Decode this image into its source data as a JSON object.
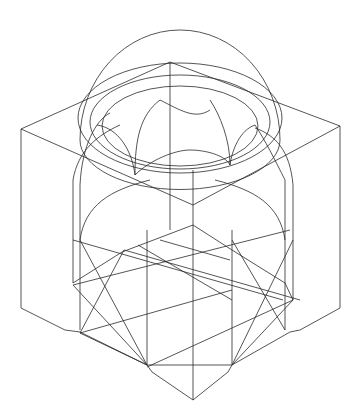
{
  "figure": {
    "stroke_color": "#2a2a2a",
    "background": "#ffffff"
  },
  "geometry": {
    "cube_edges": [
      [
        170,
        62,
        21,
        129
      ],
      [
        170,
        62,
        340,
        126
      ],
      [
        21,
        129,
        193,
        205
      ],
      [
        340,
        126,
        193,
        205
      ],
      [
        21,
        129,
        21,
        308
      ],
      [
        340,
        126,
        340,
        308
      ],
      [
        170,
        62,
        170,
        230
      ],
      [
        21,
        308,
        65,
        330
      ],
      [
        65,
        330,
        80,
        332
      ],
      [
        80,
        332,
        147,
        365
      ],
      [
        147,
        365,
        152,
        372
      ],
      [
        152,
        372,
        193,
        400
      ],
      [
        340,
        308,
        300,
        330
      ],
      [
        300,
        330,
        290,
        332
      ],
      [
        290,
        332,
        232,
        365
      ],
      [
        232,
        365,
        228,
        372
      ],
      [
        228,
        372,
        193,
        400
      ],
      [
        193,
        170,
        193,
        400
      ]
    ],
    "inner_verticals": [
      [
        73,
        180,
        73,
        283
      ],
      [
        80,
        185,
        80,
        330
      ],
      [
        147,
        230,
        147,
        365
      ],
      [
        232,
        230,
        232,
        365
      ],
      [
        285,
        180,
        285,
        330
      ],
      [
        293,
        185,
        293,
        300
      ]
    ],
    "star_lines": [
      [
        73,
        285,
        290,
        230
      ],
      [
        80,
        333,
        232,
        290
      ],
      [
        147,
        367,
        293,
        300
      ],
      [
        73,
        285,
        147,
        365
      ],
      [
        80,
        240,
        147,
        365
      ],
      [
        293,
        240,
        232,
        365
      ],
      [
        80,
        333,
        124,
        250
      ],
      [
        285,
        330,
        232,
        240
      ],
      [
        124,
        250,
        300,
        300
      ],
      [
        73,
        240,
        283,
        300
      ],
      [
        160,
        240,
        230,
        260
      ],
      [
        138,
        245,
        232,
        300
      ]
    ],
    "octagon_base": [
      [
        73,
        283
      ],
      [
        122,
        252
      ],
      [
        193,
        225
      ],
      [
        232,
        250
      ],
      [
        285,
        283
      ],
      [
        293,
        300
      ],
      [
        232,
        365
      ],
      [
        147,
        365
      ],
      [
        80,
        333
      ]
    ],
    "dome": {
      "cx": 180,
      "cy": 140,
      "rx": 100,
      "ry": 110
    },
    "drum_ellipses": [
      {
        "cx": 180,
        "cy": 118,
        "rx": 102,
        "ry": 55
      },
      {
        "cx": 180,
        "cy": 122,
        "rx": 90,
        "ry": 47
      },
      {
        "cx": 180,
        "cy": 126,
        "rx": 78,
        "ry": 40
      }
    ],
    "arches": [
      "M110,113 C96,120 82,145 80,185",
      "M97,125 C118,128 132,150 135,175",
      "M160,100 C140,115 135,140 135,175",
      "M160,100 C180,110 195,120 210,110",
      "M210,100 C220,115 230,140 230,165",
      "M255,125 C240,130 232,150 230,165",
      "M255,125 C265,140 275,160 285,180",
      "M135,175 C150,160 175,150 190,150",
      "M190,150 C205,150 225,155 230,165",
      "M80,240 C85,205 110,190 150,180",
      "M285,240 C280,205 255,190 215,180",
      "M73,180 C78,150 98,135 120,125",
      "M293,185 C290,150 275,135 255,128"
    ]
  }
}
